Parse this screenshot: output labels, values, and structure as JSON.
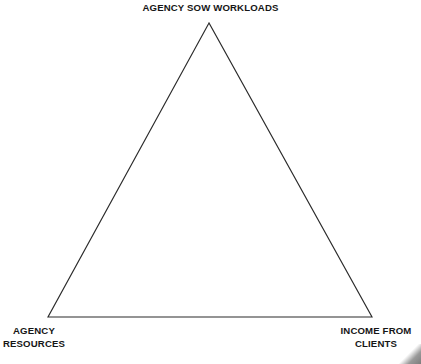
{
  "diagram": {
    "type": "triangle",
    "title": "",
    "stroke_color": "#2b2b2b",
    "fill_color": "#ffffff",
    "background_color": "#ffffff",
    "text_color": "#161616",
    "vertices": [
      {
        "id": "apex",
        "x": 209,
        "y": 23
      },
      {
        "id": "bottom_left",
        "x": 48,
        "y": 317
      },
      {
        "id": "bottom_right",
        "x": 372,
        "y": 317
      }
    ],
    "labels": {
      "top": {
        "lines": [
          "AGENCY SOW WORKLOADS"
        ],
        "text": "AGENCY SOW WORKLOADS"
      },
      "bottom_left": {
        "lines": [
          "AGENCY",
          "RESOURCES"
        ],
        "line1": "AGENCY",
        "line2": "RESOURCES"
      },
      "bottom_right": {
        "lines": [
          "INCOME FROM",
          "CLIENTS"
        ],
        "line1": "INCOME FROM",
        "line2": "CLIENTS"
      }
    }
  }
}
